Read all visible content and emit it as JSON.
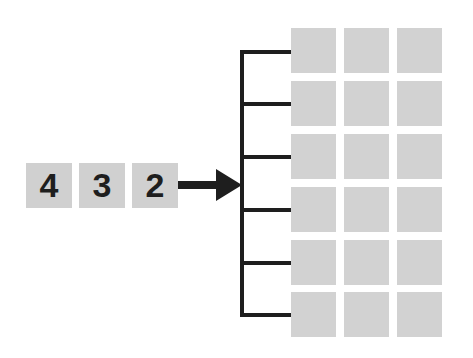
{
  "diagram": {
    "input_digits": [
      {
        "label": "4",
        "x": 26
      },
      {
        "label": "3",
        "x": 79
      },
      {
        "label": "2",
        "x": 132
      }
    ],
    "arrow": {
      "from_x": 178,
      "to_x": 242,
      "y": 185,
      "color": "#1e1e1e"
    },
    "bracket": {
      "x": 242,
      "top_y": 52,
      "bottom_y": 315,
      "branch_end_x": 291,
      "branch_ys": [
        52,
        104,
        157,
        210,
        263,
        315
      ],
      "color": "#1e1e1e"
    },
    "grid": {
      "rows": 6,
      "cols": 3,
      "col_x": [
        291,
        344,
        397
      ],
      "row_y": [
        28,
        81,
        134,
        187,
        240,
        292
      ],
      "cell_size": 45,
      "cell_color": "#d2d2d2"
    },
    "digit_box_color": "#d0d0d0"
  }
}
